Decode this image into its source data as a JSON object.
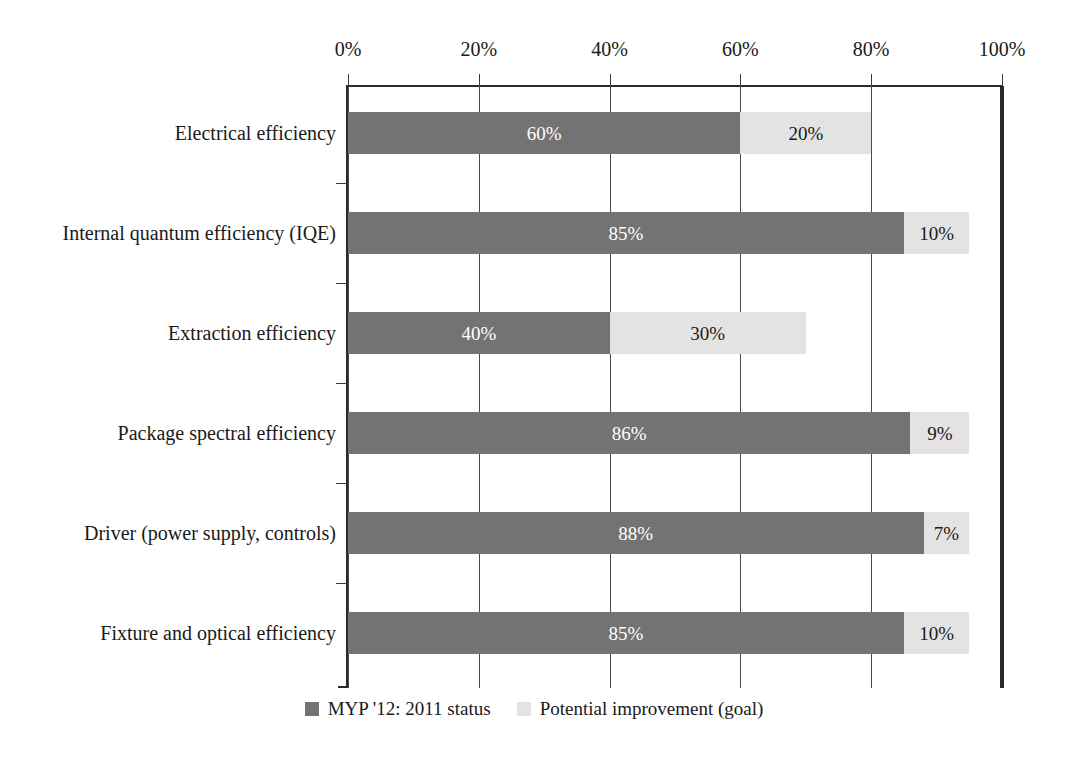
{
  "chart_data": {
    "type": "bar",
    "orientation": "horizontal",
    "stacked": true,
    "title": "",
    "subtitle": "",
    "xlabel": "",
    "ylabel": "",
    "xlim": [
      0,
      100
    ],
    "xticks": [
      "0%",
      "20%",
      "40%",
      "60%",
      "80%",
      "100%"
    ],
    "xtick_values": [
      0,
      20,
      40,
      60,
      80,
      100
    ],
    "grid": "vertical",
    "legend_position": "bottom-center",
    "categories": [
      "Electrical efficiency",
      "Internal quantum efficiency (IQE)",
      "Extraction efficiency",
      "Package spectral efficiency",
      "Driver (power supply, controls)",
      "Fixture and optical efficiency"
    ],
    "series": [
      {
        "name": "MYP '12: 2011 status",
        "color": "#737373",
        "label_color": "#ffffff",
        "values": [
          60,
          85,
          40,
          86,
          88,
          85
        ],
        "labels": [
          "60%",
          "85%",
          "40%",
          "86%",
          "88%",
          "85%"
        ]
      },
      {
        "name": "Potential improvement (goal)",
        "color": "#e3e3e3",
        "label_color": "#1a1a1a",
        "values": [
          20,
          10,
          30,
          9,
          7,
          10
        ],
        "labels": [
          "20%",
          "10%",
          "30%",
          "9%",
          "7%",
          "10%"
        ]
      }
    ],
    "colors": {
      "status": "#737373",
      "goal": "#e3e3e3",
      "axis": "#2b2b2b",
      "grid": "#4a4a4a",
      "background": "#ffffff",
      "text": "#1a1a1a"
    }
  },
  "legend": {
    "items": [
      {
        "label": "MYP '12: 2011 status",
        "swatch": "status"
      },
      {
        "label": "Potential improvement (goal)",
        "swatch": "goal"
      }
    ]
  }
}
